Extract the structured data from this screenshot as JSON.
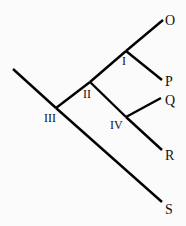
{
  "diagram": {
    "type": "cladogram",
    "tips": [
      "O",
      "P",
      "Q",
      "R",
      "S"
    ],
    "internal_nodes": [
      "I",
      "II",
      "III",
      "IV"
    ],
    "edges": [
      {
        "from": "root",
        "to": "III"
      },
      {
        "from": "III",
        "to": "II"
      },
      {
        "from": "III",
        "to": "S"
      },
      {
        "from": "II",
        "to": "I"
      },
      {
        "from": "II",
        "to": "IV"
      },
      {
        "from": "I",
        "to": "O"
      },
      {
        "from": "I",
        "to": "P"
      },
      {
        "from": "IV",
        "to": "Q"
      },
      {
        "from": "IV",
        "to": "R"
      }
    ],
    "line_color": "#000000"
  }
}
